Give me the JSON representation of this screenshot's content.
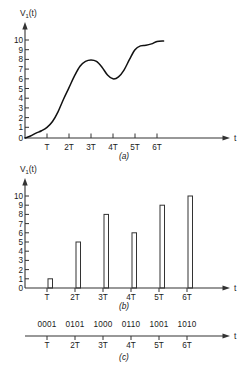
{
  "figure": {
    "title_hidden": "",
    "panels": [
      {
        "id": "a",
        "label": "(a)",
        "yaxis_title": "V",
        "yaxis_title_sub": "1",
        "yaxis_title_tail": "(t)",
        "xaxis_title": "t"
      },
      {
        "id": "b",
        "label": "(b)",
        "yaxis_title": "V",
        "yaxis_title_sub": "1",
        "yaxis_title_tail": "(t)",
        "xaxis_title": "t"
      },
      {
        "id": "c",
        "label": "(c)",
        "xaxis_title": "t"
      }
    ]
  },
  "chart_data": [
    {
      "type": "line",
      "id": "a",
      "title": "(a)",
      "xlabel": "t",
      "ylabel": "V1(t)",
      "ylim": [
        0,
        10
      ],
      "xlim": [
        0,
        7
      ],
      "grid": false,
      "legend": "none",
      "ytick_labels": [
        "0",
        "1",
        "2",
        "3",
        "4",
        "5",
        "6",
        "7",
        "8",
        "9",
        "10"
      ],
      "ytick_values": [
        0,
        1,
        2,
        3,
        4,
        5,
        6,
        7,
        8,
        9,
        10
      ],
      "xtick_labels": [
        "T",
        "2T",
        "3T",
        "4T",
        "5T",
        "6T"
      ],
      "xtick_values": [
        1,
        2,
        3,
        4,
        5,
        6
      ],
      "x": [
        0,
        0.25,
        0.5,
        0.75,
        1,
        1.25,
        1.5,
        1.75,
        2,
        2.25,
        2.5,
        2.75,
        3,
        3.25,
        3.5,
        3.75,
        4,
        4.25,
        4.5,
        4.75,
        5,
        5.25,
        5.5,
        5.75,
        6,
        6.3
      ],
      "values": [
        0,
        0.2,
        0.5,
        0.75,
        1.1,
        1.7,
        2.7,
        4.0,
        5.2,
        6.4,
        7.4,
        7.9,
        8.05,
        7.9,
        7.3,
        6.5,
        6.1,
        6.3,
        7.0,
        8.1,
        9.1,
        9.5,
        9.55,
        9.7,
        9.95,
        10.0
      ]
    },
    {
      "type": "bar",
      "id": "b",
      "title": "(b)",
      "xlabel": "t",
      "ylabel": "V1(t)",
      "ylim": [
        0,
        10
      ],
      "grid": false,
      "legend": "none",
      "ytick_labels": [
        "0",
        "1",
        "2",
        "3",
        "4",
        "5",
        "6",
        "7",
        "8",
        "9",
        "10"
      ],
      "ytick_values": [
        0,
        1,
        2,
        3,
        4,
        5,
        6,
        7,
        8,
        9,
        10
      ],
      "categories": [
        "T",
        "2T",
        "3T",
        "4T",
        "5T",
        "6T"
      ],
      "values": [
        1,
        5,
        8,
        6,
        9,
        10
      ]
    },
    {
      "type": "table",
      "id": "c",
      "title": "(c)",
      "xlabel": "t",
      "categories": [
        "T",
        "2T",
        "3T",
        "4T",
        "5T",
        "6T"
      ],
      "codes": [
        "0001",
        "0101",
        "1000",
        "0110",
        "1001",
        "1010"
      ]
    }
  ]
}
